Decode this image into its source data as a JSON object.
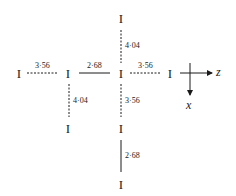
{
  "diagram": {
    "type": "iodine chain interatomic distances",
    "atoms": [
      {
        "id": "a1",
        "label": "I",
        "x": 19,
        "y": 72
      },
      {
        "id": "a2",
        "label": "I",
        "x": 68,
        "y": 72
      },
      {
        "id": "a3",
        "label": "I",
        "x": 121,
        "y": 72
      },
      {
        "id": "a4",
        "label": "I",
        "x": 170,
        "y": 72
      },
      {
        "id": "a5",
        "label": "I",
        "x": 121,
        "y": 17
      },
      {
        "id": "a6",
        "label": "I",
        "x": 68,
        "y": 128
      },
      {
        "id": "a7",
        "label": "I",
        "x": 121,
        "y": 128
      },
      {
        "id": "a8",
        "label": "I",
        "x": 121,
        "y": 184
      }
    ],
    "bonds": [
      {
        "from": "a1",
        "to": "a2",
        "style": "dashed",
        "length": "3·56"
      },
      {
        "from": "a2",
        "to": "a3",
        "style": "solid",
        "length": "2·68"
      },
      {
        "from": "a3",
        "to": "a4",
        "style": "dashed",
        "length": "3·56"
      },
      {
        "from": "a5",
        "to": "a3",
        "style": "dashed",
        "length": "4·04"
      },
      {
        "from": "a2",
        "to": "a6",
        "style": "dashed",
        "length": "4·04"
      },
      {
        "from": "a3",
        "to": "a7",
        "style": "dashed",
        "length": "3·56"
      },
      {
        "from": "a7",
        "to": "a8",
        "style": "solid",
        "length": "2·68"
      }
    ],
    "axes": {
      "horizontal": "z",
      "vertical": "x"
    }
  }
}
